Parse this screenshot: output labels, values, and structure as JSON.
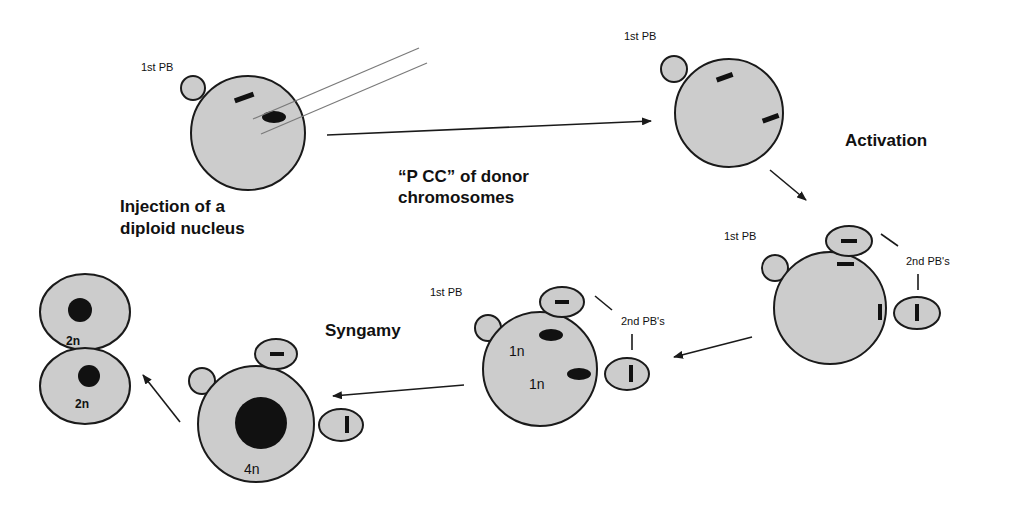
{
  "diagram": {
    "colors": {
      "cell_fill": "#cccccc",
      "outline": "#1a1a1a",
      "chromosome": "#111111",
      "pipette": "#7a7a7a",
      "background": "#ffffff"
    },
    "stages": [
      {
        "id": "injection",
        "pb_label": "1st PB",
        "caption_line1": "Injection of a",
        "caption_line2": "diploid nucleus"
      },
      {
        "id": "pcc",
        "pb_label": "1st PB",
        "step_line1": "“P CC” of donor",
        "step_line2": "chromosomes"
      },
      {
        "id": "activated",
        "step_label": "Activation",
        "pb1_label": "1st PB",
        "pb2_label": "2nd PB's"
      },
      {
        "id": "pronuclei",
        "pb1_label": "1st PB",
        "pb2_label": "2nd PB's",
        "pronucleus_a": "1n",
        "pronucleus_b": "1n"
      },
      {
        "id": "zygote",
        "step_label": "Syngamy",
        "nucleus_label": "4n"
      },
      {
        "id": "two-cell",
        "cell_a": "2n",
        "cell_b": "2n"
      }
    ]
  }
}
